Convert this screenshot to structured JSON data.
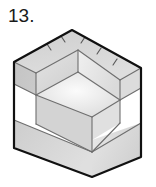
{
  "figure": {
    "number_label": "13.",
    "caption": "",
    "title": "",
    "kind": "isometric-pictorial-drawing",
    "object_name": "rectangular block with stepped notch",
    "colors": {
      "background": "#ffffff",
      "outline": "#111111",
      "interior_line": "#6b6b6b",
      "tick_line": "#5a5a5a",
      "top_face_fill": "#d4d4d4",
      "left_face_fill": "#c9c9c9",
      "right_face_fill": "#e3e3e3",
      "notch_floor_fill": "#efefef",
      "notch_back_fill": "#dcdcdc",
      "notch_side_fill": "#e8e8e8",
      "bevel_fill": "#d0d0d0",
      "label_text": "#1a1a1a"
    },
    "geometry": {
      "view": "isometric",
      "top_apex": [
        72,
        30
      ],
      "left_corner": [
        14,
        62
      ],
      "right_corner": [
        141,
        68
      ],
      "bottom_left_corner": [
        14,
        148
      ],
      "bottom_front_corner": [
        92,
        177
      ],
      "bottom_right_corner": [
        141,
        157
      ],
      "front_top_vertex": [
        92,
        95
      ],
      "notch_inner_vertex": [
        78,
        103
      ],
      "notch_top_left": [
        36,
        73
      ],
      "notch_top_right": [
        120,
        80
      ]
    },
    "annotations": {
      "tick_marks_count": 5,
      "tick_mark_description": "short perpendicular ticks along the two rear top edges"
    }
  }
}
